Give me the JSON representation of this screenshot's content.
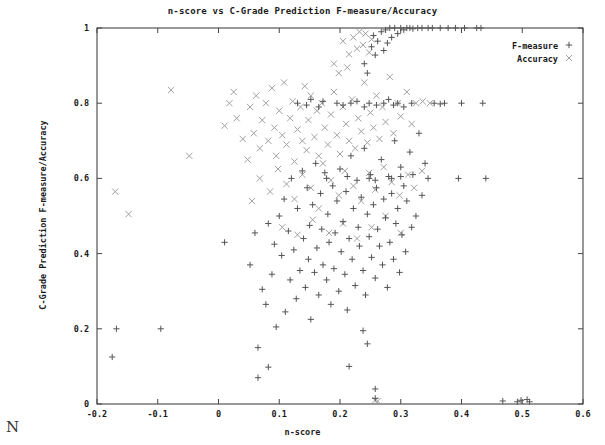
{
  "chart_data": {
    "type": "scatter",
    "title": "n-score vs C-Grade Prediction F-measure/Accuracy",
    "xlabel": "n-score",
    "ylabel": "C-Grade Prediction F-measure/Accuracy",
    "xlim": [
      -0.2,
      0.6
    ],
    "ylim": [
      0,
      1
    ],
    "xticks": [
      -0.2,
      -0.1,
      0,
      0.1,
      0.2,
      0.3,
      0.4,
      0.5,
      0.6
    ],
    "xtick_labels": [
      "-0.2",
      "-0.1",
      "0",
      "0.1",
      "0.2",
      "0.3",
      "0.4",
      "0.5",
      "0.6"
    ],
    "yticks": [
      0,
      0.2,
      0.4,
      0.6,
      0.8,
      1
    ],
    "ytick_labels": [
      "0",
      "0.2",
      "0.4",
      "0.6",
      "0.8",
      "1"
    ],
    "grid": false,
    "legend_position": "top-right",
    "series": [
      {
        "name": "F-measure",
        "marker": "plus",
        "color": "#555555",
        "points": [
          [
            -0.175,
            0.125
          ],
          [
            -0.168,
            0.2
          ],
          [
            -0.095,
            0.2
          ],
          [
            0.01,
            0.43
          ],
          [
            0.052,
            0.37
          ],
          [
            0.06,
            0.455
          ],
          [
            0.065,
            0.15
          ],
          [
            0.072,
            0.305
          ],
          [
            0.078,
            0.265
          ],
          [
            0.082,
            0.48
          ],
          [
            0.088,
            0.345
          ],
          [
            0.092,
            0.425
          ],
          [
            0.095,
            0.205
          ],
          [
            0.1,
            0.5
          ],
          [
            0.104,
            0.395
          ],
          [
            0.108,
            0.545
          ],
          [
            0.11,
            0.245
          ],
          [
            0.115,
            0.46
          ],
          [
            0.118,
            0.33
          ],
          [
            0.12,
            0.6
          ],
          [
            0.124,
            0.41
          ],
          [
            0.128,
            0.28
          ],
          [
            0.13,
            0.52
          ],
          [
            0.134,
            0.355
          ],
          [
            0.138,
            0.62
          ],
          [
            0.14,
            0.44
          ],
          [
            0.143,
            0.31
          ],
          [
            0.146,
            0.575
          ],
          [
            0.148,
            0.385
          ],
          [
            0.15,
            0.475
          ],
          [
            0.152,
            0.225
          ],
          [
            0.155,
            0.53
          ],
          [
            0.158,
            0.35
          ],
          [
            0.16,
            0.64
          ],
          [
            0.162,
            0.415
          ],
          [
            0.165,
            0.29
          ],
          [
            0.168,
            0.56
          ],
          [
            0.17,
            0.465
          ],
          [
            0.172,
            0.37
          ],
          [
            0.175,
            0.615
          ],
          [
            0.178,
            0.33
          ],
          [
            0.18,
            0.505
          ],
          [
            0.182,
            0.43
          ],
          [
            0.185,
            0.265
          ],
          [
            0.188,
            0.58
          ],
          [
            0.19,
            0.36
          ],
          [
            0.192,
            0.455
          ],
          [
            0.195,
            0.54
          ],
          [
            0.198,
            0.3
          ],
          [
            0.2,
            0.625
          ],
          [
            0.202,
            0.405
          ],
          [
            0.205,
            0.485
          ],
          [
            0.208,
            0.345
          ],
          [
            0.21,
            0.565
          ],
          [
            0.212,
            0.25
          ],
          [
            0.215,
            0.44
          ],
          [
            0.218,
            0.66
          ],
          [
            0.22,
            0.385
          ],
          [
            0.222,
            0.52
          ],
          [
            0.225,
            0.315
          ],
          [
            0.228,
            0.595
          ],
          [
            0.23,
            0.47
          ],
          [
            0.232,
            0.42
          ],
          [
            0.235,
            0.55
          ],
          [
            0.238,
            0.355
          ],
          [
            0.24,
            0.68
          ],
          [
            0.242,
            0.29
          ],
          [
            0.245,
            0.505
          ],
          [
            0.248,
            0.445
          ],
          [
            0.25,
            0.61
          ],
          [
            0.252,
            0.39
          ],
          [
            0.255,
            0.53
          ],
          [
            0.258,
            0.335
          ],
          [
            0.26,
            0.575
          ],
          [
            0.262,
            0.465
          ],
          [
            0.265,
            0.42
          ],
          [
            0.268,
            0.65
          ],
          [
            0.27,
            0.37
          ],
          [
            0.272,
            0.545
          ],
          [
            0.275,
            0.495
          ],
          [
            0.278,
            0.31
          ],
          [
            0.28,
            0.605
          ],
          [
            0.282,
            0.43
          ],
          [
            0.285,
            0.56
          ],
          [
            0.288,
            0.385
          ],
          [
            0.29,
            0.7
          ],
          [
            0.292,
            0.48
          ],
          [
            0.295,
            0.52
          ],
          [
            0.298,
            0.35
          ],
          [
            0.3,
            0.63
          ],
          [
            0.302,
            0.45
          ],
          [
            0.305,
            0.58
          ],
          [
            0.308,
            0.405
          ],
          [
            0.31,
            0.54
          ],
          [
            0.315,
            0.67
          ],
          [
            0.318,
            0.47
          ],
          [
            0.32,
            0.61
          ],
          [
            0.325,
            0.5
          ],
          [
            0.33,
            0.72
          ],
          [
            0.335,
            0.555
          ],
          [
            0.34,
            0.64
          ],
          [
            0.345,
            0.6
          ],
          [
            0.13,
            0.8
          ],
          [
            0.145,
            0.795
          ],
          [
            0.152,
            0.81
          ],
          [
            0.165,
            0.79
          ],
          [
            0.172,
            0.805
          ],
          [
            0.195,
            0.8
          ],
          [
            0.205,
            0.795
          ],
          [
            0.218,
            0.8
          ],
          [
            0.228,
            0.805
          ],
          [
            0.24,
            0.79
          ],
          [
            0.248,
            0.8
          ],
          [
            0.26,
            0.795
          ],
          [
            0.272,
            0.8
          ],
          [
            0.28,
            0.81
          ],
          [
            0.288,
            0.795
          ],
          [
            0.295,
            0.8
          ],
          [
            0.305,
            0.79
          ],
          [
            0.318,
            0.8
          ],
          [
            0.355,
            0.8
          ],
          [
            0.365,
            0.798
          ],
          [
            0.372,
            0.8
          ],
          [
            0.4,
            0.8
          ],
          [
            0.435,
            0.8
          ],
          [
            0.178,
            0.6
          ],
          [
            0.212,
            0.605
          ],
          [
            0.248,
            0.6
          ],
          [
            0.258,
            0.595
          ],
          [
            0.285,
            0.6
          ],
          [
            0.3,
            0.605
          ],
          [
            0.395,
            0.6
          ],
          [
            0.44,
            0.6
          ],
          [
            0.252,
            0.95
          ],
          [
            0.255,
            0.98
          ],
          [
            0.258,
            0.928
          ],
          [
            0.262,
            0.965
          ],
          [
            0.268,
            0.99
          ],
          [
            0.272,
            0.94
          ],
          [
            0.275,
            0.995
          ],
          [
            0.278,
            0.96
          ],
          [
            0.282,
            1.0
          ],
          [
            0.285,
            0.975
          ],
          [
            0.29,
            1.0
          ],
          [
            0.295,
            0.985
          ],
          [
            0.3,
            1.0
          ],
          [
            0.305,
            0.995
          ],
          [
            0.31,
            1.0
          ],
          [
            0.315,
            1.0
          ],
          [
            0.32,
            0.998
          ],
          [
            0.328,
            1.0
          ],
          [
            0.335,
            1.0
          ],
          [
            0.345,
            1.0
          ],
          [
            0.352,
            1.0
          ],
          [
            0.365,
            1.0
          ],
          [
            0.378,
            1.0
          ],
          [
            0.39,
            1.0
          ],
          [
            0.405,
            1.0
          ],
          [
            0.425,
            1.0
          ],
          [
            0.432,
            1.0
          ],
          [
            0.24,
            0.905
          ],
          [
            0.245,
            0.88
          ],
          [
            0.258,
            0.015
          ],
          [
            0.258,
            0.04
          ],
          [
            0.468,
            0.008
          ],
          [
            0.492,
            0.006
          ],
          [
            0.498,
            0.01
          ],
          [
            0.508,
            0.012
          ],
          [
            0.512,
            0.006
          ],
          [
            0.065,
            0.07
          ],
          [
            0.082,
            0.098
          ],
          [
            0.215,
            0.1
          ],
          [
            0.238,
            0.195
          ],
          [
            0.245,
            0.16
          ]
        ]
      },
      {
        "name": "Accuracy",
        "marker": "cross",
        "color": "#a0a0a0",
        "points": [
          [
            -0.17,
            0.565
          ],
          [
            -0.148,
            0.505
          ],
          [
            -0.078,
            0.835
          ],
          [
            -0.048,
            0.66
          ],
          [
            0.01,
            0.74
          ],
          [
            0.018,
            0.8
          ],
          [
            0.025,
            0.83
          ],
          [
            0.03,
            0.76
          ],
          [
            0.04,
            0.705
          ],
          [
            0.048,
            0.65
          ],
          [
            0.052,
            0.79
          ],
          [
            0.058,
            0.72
          ],
          [
            0.062,
            0.82
          ],
          [
            0.068,
            0.68
          ],
          [
            0.072,
            0.755
          ],
          [
            0.078,
            0.8
          ],
          [
            0.082,
            0.7
          ],
          [
            0.088,
            0.84
          ],
          [
            0.092,
            0.735
          ],
          [
            0.095,
            0.66
          ],
          [
            0.1,
            0.78
          ],
          [
            0.105,
            0.715
          ],
          [
            0.108,
            0.855
          ],
          [
            0.112,
            0.69
          ],
          [
            0.118,
            0.76
          ],
          [
            0.122,
            0.805
          ],
          [
            0.125,
            0.645
          ],
          [
            0.13,
            0.73
          ],
          [
            0.135,
            0.79
          ],
          [
            0.138,
            0.7
          ],
          [
            0.142,
            0.845
          ],
          [
            0.145,
            0.675
          ],
          [
            0.148,
            0.755
          ],
          [
            0.152,
            0.82
          ],
          [
            0.158,
            0.71
          ],
          [
            0.162,
            0.78
          ],
          [
            0.165,
            0.66
          ],
          [
            0.17,
            0.8
          ],
          [
            0.175,
            0.735
          ],
          [
            0.18,
            0.69
          ],
          [
            0.185,
            0.77
          ],
          [
            0.19,
            0.83
          ],
          [
            0.195,
            0.715
          ],
          [
            0.2,
            0.665
          ],
          [
            0.205,
            0.79
          ],
          [
            0.21,
            0.745
          ],
          [
            0.215,
            0.7
          ],
          [
            0.22,
            0.81
          ],
          [
            0.225,
            0.68
          ],
          [
            0.23,
            0.76
          ],
          [
            0.235,
            0.725
          ],
          [
            0.24,
            0.855
          ],
          [
            0.245,
            0.695
          ],
          [
            0.25,
            0.775
          ],
          [
            0.255,
            0.735
          ],
          [
            0.26,
            0.82
          ],
          [
            0.265,
            0.705
          ],
          [
            0.27,
            0.79
          ],
          [
            0.275,
            0.75
          ],
          [
            0.282,
            0.87
          ],
          [
            0.288,
            0.72
          ],
          [
            0.295,
            0.8
          ],
          [
            0.3,
            0.765
          ],
          [
            0.31,
            0.83
          ],
          [
            0.318,
            0.745
          ],
          [
            0.325,
            0.8
          ],
          [
            0.055,
            0.54
          ],
          [
            0.068,
            0.6
          ],
          [
            0.085,
            0.565
          ],
          [
            0.098,
            0.625
          ],
          [
            0.112,
            0.585
          ],
          [
            0.125,
            0.545
          ],
          [
            0.138,
            0.61
          ],
          [
            0.152,
            0.575
          ],
          [
            0.165,
            0.52
          ],
          [
            0.172,
            0.64
          ],
          [
            0.185,
            0.595
          ],
          [
            0.198,
            0.555
          ],
          [
            0.208,
            0.62
          ],
          [
            0.222,
            0.58
          ],
          [
            0.235,
            0.54
          ],
          [
            0.248,
            0.615
          ],
          [
            0.258,
            0.57
          ],
          [
            0.272,
            0.63
          ],
          [
            0.285,
            0.59
          ],
          [
            0.298,
            0.555
          ],
          [
            0.312,
            0.61
          ],
          [
            0.322,
            0.575
          ],
          [
            0.335,
            0.62
          ],
          [
            0.105,
            0.47
          ],
          [
            0.13,
            0.45
          ],
          [
            0.155,
            0.49
          ],
          [
            0.182,
            0.455
          ],
          [
            0.205,
            0.48
          ],
          [
            0.228,
            0.44
          ],
          [
            0.252,
            0.47
          ],
          [
            0.275,
            0.5
          ],
          [
            0.3,
            0.455
          ],
          [
            0.205,
            0.965
          ],
          [
            0.215,
            0.93
          ],
          [
            0.222,
            0.975
          ],
          [
            0.228,
            0.945
          ],
          [
            0.232,
            0.99
          ],
          [
            0.238,
            0.955
          ],
          [
            0.242,
            0.985
          ],
          [
            0.248,
            0.935
          ],
          [
            0.252,
            0.97
          ],
          [
            0.19,
            0.905
          ],
          [
            0.198,
            0.88
          ],
          [
            0.212,
            0.895
          ],
          [
            0.258,
            0.01
          ],
          [
            0.262,
            0.008
          ],
          [
            0.348,
            0.8
          ],
          [
            0.336,
            0.805
          ]
        ]
      }
    ]
  },
  "legend": {
    "entries": [
      {
        "label": "F-measure",
        "marker": "+"
      },
      {
        "label": "Accuracy",
        "marker": "×"
      }
    ]
  },
  "annotations": {
    "corner_letter": "N"
  },
  "colors": {
    "fmeasure": "#555555",
    "accuracy": "#a0a0a0",
    "axis": "#444444",
    "text": "#1a1a1a"
  }
}
